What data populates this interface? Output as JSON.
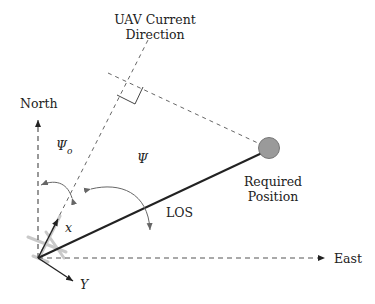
{
  "diagram": {
    "labels": {
      "uav_direction": [
        "UAV Current",
        "Direction"
      ],
      "north": "North",
      "east": "East",
      "psi_o": "Ψ",
      "psi_o_sub": "o",
      "psi": "Ψ",
      "los": "LOS",
      "required_position": [
        "Required",
        "Position"
      ],
      "body_x": "x",
      "body_y": "Y"
    },
    "colors": {
      "line": "#222222",
      "dashed": "#555555",
      "target_fill": "#9a9a9a",
      "target_stroke": "#777777",
      "aircraft": "#bdbdbd"
    },
    "icons": {
      "aircraft": "aircraft-icon",
      "target": "circle-marker"
    }
  }
}
